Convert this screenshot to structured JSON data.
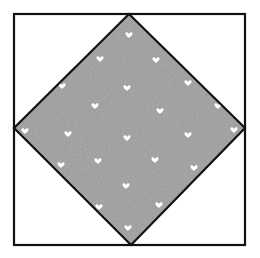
{
  "figure": {
    "colors": {
      "background": "#ffffff",
      "outline": "#111111",
      "fill": "#9d9d9d",
      "fill_texture": "#8f8f8f",
      "heart": "#ffffff"
    },
    "outer_square": {
      "x1": 14,
      "y1": 14,
      "x2": 245,
      "y2": 245
    },
    "diamond": {
      "top": [
        129,
        14
      ],
      "right": [
        245,
        128
      ],
      "bottom": [
        131,
        245
      ],
      "left": [
        14,
        128
      ]
    },
    "hearts": [
      [
        129,
        35
      ],
      [
        100,
        59
      ],
      [
        156,
        60
      ],
      [
        62,
        86
      ],
      [
        127,
        88
      ],
      [
        188,
        83
      ],
      [
        95,
        106
      ],
      [
        160,
        111
      ],
      [
        218,
        106
      ],
      [
        25,
        131
      ],
      [
        68,
        134
      ],
      [
        127,
        138
      ],
      [
        188,
        135
      ],
      [
        234,
        130
      ],
      [
        61,
        165
      ],
      [
        98,
        161
      ],
      [
        155,
        160
      ],
      [
        194,
        168
      ],
      [
        126,
        186
      ],
      [
        99,
        207
      ],
      [
        159,
        205
      ],
      [
        128,
        228
      ]
    ]
  }
}
